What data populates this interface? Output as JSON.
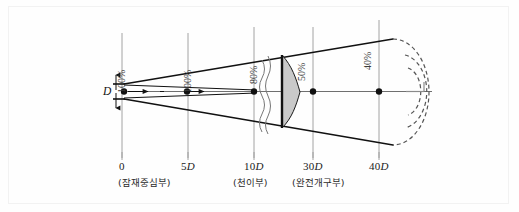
{
  "figure": {
    "background_color": "#fefefe",
    "border_color": "#f2f2f2",
    "line_color": "#111111",
    "gridline_color": "#9a9a9a",
    "profile_fill": "#c9c9c9",
    "dashed_arc_color": "#555555"
  },
  "nozzle": {
    "diameter_label": "D"
  },
  "axis": {
    "ticks": [
      {
        "value": "0",
        "italic_suffix": ""
      },
      {
        "value": "5",
        "italic_suffix": "D"
      },
      {
        "value": "10",
        "italic_suffix": "D"
      },
      {
        "value": "30",
        "italic_suffix": "D"
      },
      {
        "value": "40",
        "italic_suffix": "D"
      }
    ]
  },
  "percent_labels": [
    {
      "text": "100%"
    },
    {
      "text": "100%"
    },
    {
      "text": "80%"
    },
    {
      "text": "50%"
    },
    {
      "text": "40%"
    }
  ],
  "regions": [
    {
      "label": "(잠재중심부)"
    },
    {
      "label": "(천이부)"
    },
    {
      "label": "(완전개구부)"
    }
  ]
}
